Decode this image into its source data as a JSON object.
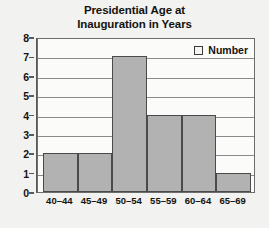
{
  "chart_data": {
    "type": "bar",
    "title": "Presidential Age at Inauguration in Years",
    "title_lines": [
      "Presidential Age at",
      "Inauguration in Years"
    ],
    "categories": [
      "40–44",
      "45–49",
      "50–54",
      "55–59",
      "60–64",
      "65–69"
    ],
    "values": [
      2,
      2,
      7,
      4,
      4,
      1
    ],
    "series": [
      {
        "name": "Number",
        "values": [
          2,
          2,
          7,
          4,
          4,
          1
        ]
      }
    ],
    "xlabel": "",
    "ylabel": "",
    "ylim": [
      0,
      8
    ],
    "yticks": [
      0,
      1,
      2,
      3,
      4,
      5,
      6,
      7,
      8
    ],
    "ytick_labels": [
      "0",
      "1",
      "2",
      "3",
      "4",
      "5",
      "6",
      "7",
      "8"
    ],
    "grid": true,
    "grid_axis": "y",
    "legend": {
      "entries": [
        "Number"
      ],
      "position": "top-right-inside"
    },
    "bar_style": "histogram-adjacent",
    "colors": {
      "bar_fill": "#b2b2b2",
      "bar_border": "#4a4a4a",
      "plot_background": "#fbfbfa",
      "page_background": "#f2f2f0",
      "gridline": "#8a8a8a",
      "axis": "#5a5a5a",
      "text": "#14120f",
      "legend_swatch_fill": "#f4f4f2"
    }
  }
}
